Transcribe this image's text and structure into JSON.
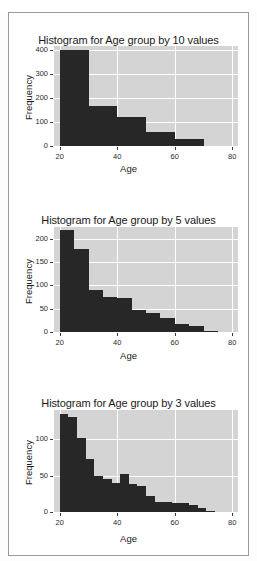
{
  "top_clipped_text": "· · · · · ·",
  "panel": {
    "background_color": "#ffffff",
    "border_color": "#9a9a9a"
  },
  "style": {
    "plot_background": "#d4d4d4",
    "grid_color": "#ffffff",
    "bar_color": "#272727",
    "text_color": "#1a1a1a"
  },
  "chart_data": [
    {
      "type": "bar",
      "title": "Histogram for Age group by 10 values",
      "xlabel": "Age",
      "ylabel": "Frequency",
      "binwidth": 10,
      "xlim": [
        18,
        82
      ],
      "ylim": [
        0,
        415
      ],
      "xticks": [
        20,
        40,
        60,
        80
      ],
      "yticks": [
        0,
        100,
        200,
        300,
        400
      ],
      "grid": true,
      "legend": "none",
      "bins": [
        {
          "x0": 20,
          "x1": 30,
          "value": 400
        },
        {
          "x0": 30,
          "x1": 40,
          "value": 165
        },
        {
          "x0": 40,
          "x1": 50,
          "value": 120
        },
        {
          "x0": 50,
          "x1": 60,
          "value": 57
        },
        {
          "x0": 60,
          "x1": 70,
          "value": 28
        }
      ]
    },
    {
      "type": "bar",
      "title": "Histogram for Age group by 5 values",
      "xlabel": "Age",
      "ylabel": "Frequency",
      "binwidth": 5,
      "xlim": [
        18,
        82
      ],
      "ylim": [
        0,
        225
      ],
      "xticks": [
        20,
        40,
        60,
        80
      ],
      "yticks": [
        0,
        50,
        100,
        150,
        200
      ],
      "grid": true,
      "legend": "none",
      "bins": [
        {
          "x0": 20,
          "x1": 25,
          "value": 218
        },
        {
          "x0": 25,
          "x1": 30,
          "value": 177
        },
        {
          "x0": 30,
          "x1": 35,
          "value": 91
        },
        {
          "x0": 35,
          "x1": 40,
          "value": 74
        },
        {
          "x0": 40,
          "x1": 45,
          "value": 72
        },
        {
          "x0": 45,
          "x1": 50,
          "value": 48
        },
        {
          "x0": 50,
          "x1": 55,
          "value": 40
        },
        {
          "x0": 55,
          "x1": 60,
          "value": 30
        },
        {
          "x0": 60,
          "x1": 65,
          "value": 18
        },
        {
          "x0": 65,
          "x1": 70,
          "value": 13
        },
        {
          "x0": 70,
          "x1": 75,
          "value": 2
        }
      ]
    },
    {
      "type": "bar",
      "title": "Histogram for Age group by 3 values",
      "xlabel": "Age",
      "ylabel": "Frequency",
      "binwidth": 3,
      "xlim": [
        18,
        82
      ],
      "ylim": [
        0,
        140
      ],
      "xticks": [
        20,
        40,
        60,
        80
      ],
      "yticks": [
        0,
        50,
        100
      ],
      "grid": true,
      "legend": "none",
      "bins": [
        {
          "x0": 20,
          "x1": 23,
          "value": 134
        },
        {
          "x0": 23,
          "x1": 26,
          "value": 131
        },
        {
          "x0": 26,
          "x1": 29,
          "value": 101
        },
        {
          "x0": 29,
          "x1": 32,
          "value": 73
        },
        {
          "x0": 32,
          "x1": 35,
          "value": 50
        },
        {
          "x0": 35,
          "x1": 38,
          "value": 45
        },
        {
          "x0": 38,
          "x1": 41,
          "value": 40
        },
        {
          "x0": 41,
          "x1": 44,
          "value": 52
        },
        {
          "x0": 44,
          "x1": 47,
          "value": 38
        },
        {
          "x0": 47,
          "x1": 50,
          "value": 36
        },
        {
          "x0": 50,
          "x1": 53,
          "value": 22
        },
        {
          "x0": 53,
          "x1": 56,
          "value": 14
        },
        {
          "x0": 56,
          "x1": 59,
          "value": 14
        },
        {
          "x0": 59,
          "x1": 62,
          "value": 12
        },
        {
          "x0": 62,
          "x1": 65,
          "value": 12
        },
        {
          "x0": 65,
          "x1": 68,
          "value": 9
        },
        {
          "x0": 68,
          "x1": 71,
          "value": 5
        },
        {
          "x0": 71,
          "x1": 74,
          "value": 1
        }
      ]
    }
  ]
}
